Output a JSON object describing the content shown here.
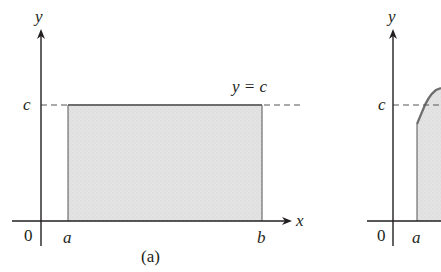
{
  "figure": {
    "panels": [
      {
        "id": "a",
        "caption": "(a)",
        "axis_labels": {
          "x": "x",
          "y": "y"
        },
        "origin_label": "0",
        "tick_labels": {
          "a": "a",
          "b": "b",
          "c": "c"
        },
        "curve_label": "y = c",
        "curve": "constant function y = c",
        "region": "shaded rectangle from x=a to x=b under y=c"
      },
      {
        "id": "b",
        "caption": "",
        "axis_labels": {
          "y": "y"
        },
        "origin_label": "0",
        "tick_labels": {
          "a": "a",
          "c": "c"
        },
        "curve": "increasing curve starting at x=a, partially cut off",
        "region": "shaded region under curve starting at x=a"
      }
    ],
    "colors": {
      "axis": "#231f20",
      "shade": "#e2e2e2",
      "curve": "#6d6d6d",
      "dashed": "#555555"
    }
  }
}
